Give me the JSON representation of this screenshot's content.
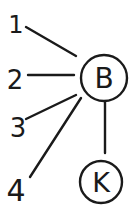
{
  "diagram": {
    "type": "graph",
    "style": "hand-drawn",
    "stroke_color": "#1a1a1a",
    "background": "#ffffff",
    "nodes": [
      {
        "id": "B",
        "label": "B",
        "shape": "circle",
        "cx": 104,
        "cy": 78,
        "r": 23
      },
      {
        "id": "K",
        "label": "K",
        "shape": "circle",
        "cx": 101,
        "cy": 182,
        "r": 21
      },
      {
        "id": "1",
        "label": "1",
        "shape": "text",
        "x": 16,
        "y": 32
      },
      {
        "id": "2",
        "label": "2",
        "shape": "text",
        "x": 14,
        "y": 88
      },
      {
        "id": "3",
        "label": "3",
        "shape": "text",
        "x": 18,
        "y": 136
      },
      {
        "id": "4",
        "label": "4",
        "shape": "text",
        "x": 16,
        "y": 200
      }
    ],
    "edges": [
      {
        "from": "1",
        "to": "B",
        "x1": 26,
        "y1": 27,
        "x2": 76,
        "y2": 56
      },
      {
        "from": "2",
        "to": "B",
        "x1": 28,
        "y1": 75,
        "x2": 74,
        "y2": 75
      },
      {
        "from": "3",
        "to": "B",
        "x1": 26,
        "y1": 119,
        "x2": 76,
        "y2": 95
      },
      {
        "from": "4",
        "to": "B",
        "x1": 30,
        "y1": 177,
        "x2": 81,
        "y2": 98
      },
      {
        "from": "B",
        "to": "K",
        "x1": 105,
        "y1": 102,
        "x2": 105,
        "y2": 153
      }
    ]
  }
}
